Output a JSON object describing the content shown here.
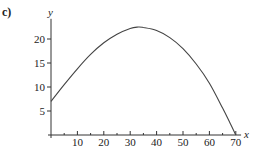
{
  "figure": {
    "part_label": "c)"
  },
  "chart_data": {
    "type": "line",
    "title": "",
    "xlabel": "x",
    "ylabel": "y",
    "xlim": [
      0,
      72
    ],
    "ylim": [
      0,
      24
    ],
    "grid": false,
    "legend": null,
    "x_ticks": [
      10,
      20,
      30,
      40,
      50,
      60,
      70
    ],
    "x_minor_ticks": [
      5,
      15,
      25,
      35,
      45,
      55,
      65
    ],
    "y_ticks": [
      5,
      10,
      15,
      20
    ],
    "series": [
      {
        "name": "curve",
        "color": "#444444",
        "x": [
          0,
          5,
          10,
          15,
          20,
          25,
          30,
          33,
          35,
          40,
          45,
          50,
          55,
          60,
          65,
          68,
          70
        ],
        "y": [
          7,
          10.5,
          13.8,
          16.8,
          19.2,
          21,
          22.2,
          22.5,
          22.4,
          21.8,
          20.3,
          18,
          14.8,
          10.8,
          5.6,
          2.3,
          0
        ]
      }
    ]
  }
}
